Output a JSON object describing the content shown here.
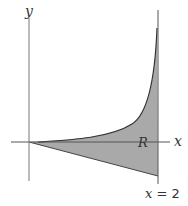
{
  "figure": {
    "labels": {
      "y_axis": "y",
      "x_axis": "x",
      "region": "R",
      "right_boundary_var": "x",
      "right_boundary_eq": " = 2"
    },
    "colors": {
      "fill": "#a9a9a9",
      "axis": "#555555",
      "curve": "#333333",
      "text": "#333333",
      "background": "#ffffff"
    }
  }
}
